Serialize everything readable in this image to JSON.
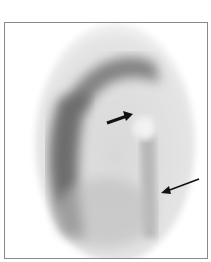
{
  "image": {
    "description": "Grayscale nuclear medicine scan (oval field of view) with two black arrows indicating findings",
    "colors": {
      "background": "#ffffff",
      "frame": "#8a8a8a",
      "uptake_dark": "#4a4a4a",
      "arrow": "#111111"
    }
  },
  "annotations": {
    "arrows": [
      {
        "name": "short-thick-arrow",
        "from": [
          106,
          122
        ],
        "to": [
          130,
          114
        ]
      },
      {
        "name": "long-thin-arrow",
        "from": [
          198,
          178
        ],
        "to": [
          160,
          191
        ]
      }
    ]
  }
}
